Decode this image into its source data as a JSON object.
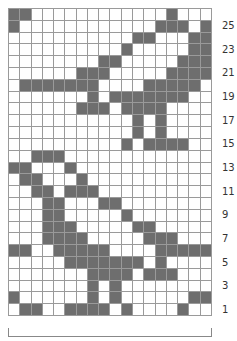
{
  "chart": {
    "title": "",
    "columns": 18,
    "rows": 26,
    "filled_color": "#6e6e6e",
    "empty_color": "#ffffff",
    "grid_color": "#9a9a9a",
    "row_labels": [
      "25",
      "23",
      "21",
      "19",
      "17",
      "15",
      "13",
      "11",
      "9",
      "7",
      "5",
      "3",
      "1"
    ],
    "filled_cells_by_row": {
      "26": [
        1,
        2,
        15
      ],
      "25": [
        1,
        14,
        15,
        16,
        18
      ],
      "24": [
        12,
        13,
        17,
        18
      ],
      "23": [
        11,
        17,
        18
      ],
      "22": [
        9,
        10,
        16,
        17,
        18
      ],
      "21": [
        7,
        8,
        9,
        15,
        16,
        17,
        18
      ],
      "20": [
        2,
        3,
        4,
        5,
        6,
        7,
        8,
        13,
        14,
        15,
        16,
        17
      ],
      "19": [
        8,
        10,
        11,
        12,
        13,
        14,
        15,
        16
      ],
      "18": [
        7,
        8,
        9,
        11,
        12,
        13,
        14
      ],
      "17": [
        12,
        14
      ],
      "16": [
        12,
        14
      ],
      "15": [
        11,
        13,
        14,
        15,
        16
      ],
      "14": [
        3,
        4,
        5
      ],
      "13": [
        1,
        2,
        6
      ],
      "12": [
        2,
        3,
        7
      ],
      "11": [
        3,
        4,
        6,
        7,
        8
      ],
      "10": [
        4,
        5,
        9,
        10
      ],
      "9": [
        4,
        5,
        11
      ],
      "8": [
        4,
        5,
        6,
        12,
        13
      ],
      "7": [
        4,
        5,
        6,
        7,
        13,
        14,
        15
      ],
      "6": [
        1,
        2,
        5,
        6,
        7,
        8,
        9,
        14,
        15,
        16,
        17,
        18
      ],
      "5": [
        6,
        7,
        8,
        9,
        10,
        11,
        12,
        14
      ],
      "4": [
        8,
        9,
        10,
        11,
        13,
        14,
        15
      ],
      "3": [
        8,
        10
      ],
      "2": [
        1,
        8,
        10,
        17,
        18
      ],
      "1": [
        2,
        3,
        6,
        7,
        8,
        9,
        11,
        16
      ]
    },
    "repeat_bracket": "full width (18 stitches)"
  }
}
